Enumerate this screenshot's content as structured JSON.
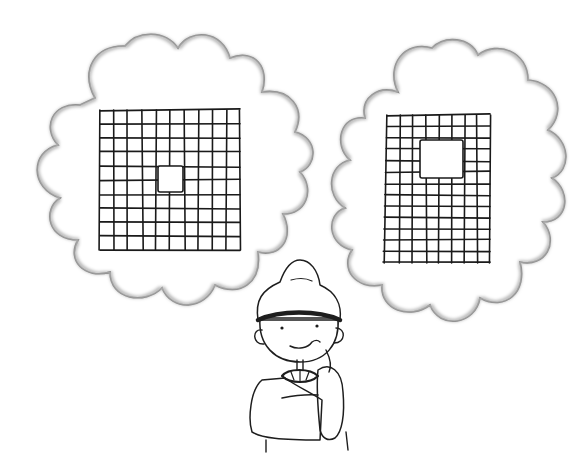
{
  "illustration": {
    "description": "Hand-drawn line illustration of a child in a knit hat thinking of two grids",
    "left_thought": {
      "shape": "cloud",
      "grid_rows": 10,
      "grid_cols": 10,
      "missing_cells": "one cell in the center",
      "box": {
        "x": 100,
        "y": 110,
        "w": 140,
        "h": 140
      },
      "hole": {
        "x": 158,
        "y": 166,
        "w": 25,
        "h": 26
      }
    },
    "right_thought": {
      "shape": "cloud",
      "grid_rows": 13,
      "grid_cols": 8,
      "missing_cells": "a 3x3 block in the upper center",
      "box": {
        "x": 387,
        "y": 115,
        "w": 103,
        "h": 148
      },
      "hole": {
        "x": 420,
        "y": 140,
        "w": 43,
        "h": 38
      }
    },
    "character": {
      "hat": "knit cap with dark band",
      "expression": "smiling",
      "pose": "one hand raised to chin"
    },
    "colors": {
      "ink": "#1e1e1e",
      "background": "#ffffff",
      "shading": "#b8b8b8"
    }
  }
}
